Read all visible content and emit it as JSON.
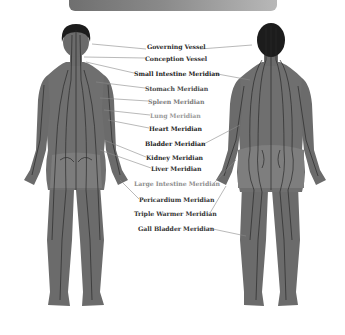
{
  "diagram": {
    "title_banner": "",
    "figures": [
      {
        "view": "front"
      },
      {
        "view": "back"
      }
    ],
    "labels": [
      {
        "text": "Governing Vessel",
        "color": "#2a2a2a",
        "x": 147,
        "y": 42
      },
      {
        "text": "Conception Vessel",
        "color": "#2e2e2e",
        "x": 145,
        "y": 56
      },
      {
        "text": "Small Intestine Meridian",
        "color": "#222222",
        "x": 134,
        "y": 71
      },
      {
        "text": "Stomach Meridian",
        "color": "#4a4a4a",
        "x": 145,
        "y": 86
      },
      {
        "text": "Spleen Meridian",
        "color": "#7a7a7a",
        "x": 148,
        "y": 99
      },
      {
        "text": "Lung Meridian",
        "color": "#9a9a9a",
        "x": 150,
        "y": 113
      },
      {
        "text": "Heart Meridian",
        "color": "#1e1e1e",
        "x": 149,
        "y": 126
      },
      {
        "text": "Bladder Meridian",
        "color": "#1a1a1a",
        "x": 145,
        "y": 141
      },
      {
        "text": "Kidney Meridian",
        "color": "#2a2a2a",
        "x": 146,
        "y": 155
      },
      {
        "text": "Liver Meridian",
        "color": "#2e2e2e",
        "x": 151,
        "y": 166
      },
      {
        "text": "Large Intestine Meridian",
        "color": "#8e8e8e",
        "x": 134,
        "y": 181
      },
      {
        "text": "Pericardium Meridian",
        "color": "#333333",
        "x": 139,
        "y": 197
      },
      {
        "text": "Triple Warmer Meridian",
        "color": "#333333",
        "x": 134,
        "y": 211
      },
      {
        "text": "Gall Bladder Meridian",
        "color": "#333333",
        "x": 138,
        "y": 226
      }
    ],
    "colors": {
      "body": "#6b6b6b",
      "body_light": "#858585",
      "hair": "#1c1c1c",
      "meridian_line": "#2a2a2a",
      "leader_line": "#8a8a8a",
      "banner_start": "#6f6f6f",
      "banner_end": "#b8b8b8"
    }
  }
}
